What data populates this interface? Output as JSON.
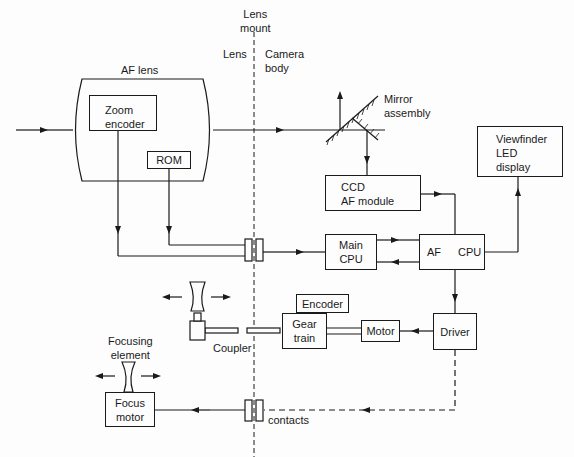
{
  "header": {
    "lens_mount": "Lens\nmount",
    "lens_side": "Lens",
    "body_side": "Camera\nbody"
  },
  "af_lens": {
    "title": "AF lens",
    "zoom_encoder": "Zoom\nencoder",
    "rom": "ROM"
  },
  "camera_body": {
    "mirror": "Mirror\nassembly",
    "ccd": "CCD\nAF module",
    "viewfinder": "Viewfinder\nLED\ndisplay",
    "main_cpu": "Main\nCPU",
    "af_cpu_left": "AF",
    "af_cpu_right": "CPU",
    "encoder": "Encoder",
    "gear_train": "Gear\ntrain",
    "motor": "Motor",
    "driver": "Driver"
  },
  "mechanics": {
    "coupler": "Coupler",
    "focusing_element": "Focusing\nelement",
    "focus_motor": "Focus\nmotor",
    "contacts": "contacts"
  },
  "colors": {
    "ink": "#1a1a1a",
    "paper": "#fdfdfd"
  }
}
